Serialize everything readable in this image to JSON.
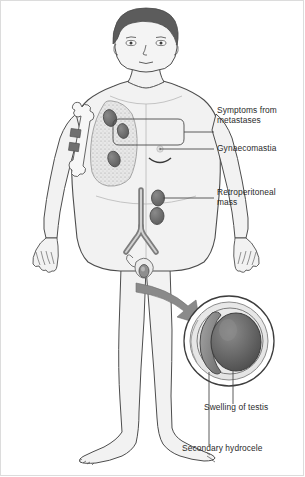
{
  "figure": {
    "type": "medical-illustration"
  },
  "labels": {
    "symptoms_metastases": "Symptoms from\nmetastases",
    "gynaecomastia": "Gynaecomastia",
    "retroperitoneal_mass": "Retroperitoneal\nmass",
    "swelling_of_testis": "Swelling of testis",
    "secondary_hydrocele": "Secondary hydrocele"
  },
  "anatomy": {
    "hair": "hair-region",
    "face": "face-region",
    "torso": "torso-region",
    "left_arm": "left-arm-region",
    "right_arm": "right-arm-region",
    "left_hand": "left-hand-region",
    "right_hand": "right-hand-region",
    "left_leg": "left-leg-region",
    "right_leg": "right-leg-region",
    "lung": "lung-with-metastases",
    "humerus": "humerus-bone-with-metastases",
    "aorta": "aorta-bifurcation",
    "nipple": "nipple-gynaecomastia",
    "scrotum": "scrotum-region",
    "inset_circle": "magnified-testis-inset",
    "testis": "testis-mass",
    "epididymis": "epididymis",
    "hydrocele_fluid": "hydrocele-fluid-layer",
    "magnify_arrow": "magnification-arrow"
  },
  "markers": {
    "lung_nodule_count": 3,
    "bone_metastasis_band_count": 2,
    "retroperitoneal_node_count": 2
  },
  "colors": {
    "outline": "#4d4d4d",
    "body_fill": "#f2f2f2",
    "hair_fill": "#5c5c5c",
    "nodule_fill": "#6e6e6e",
    "lung_fill": "#e4e4e4",
    "bone_fill": "#f7f7f7",
    "bone_lesion": "#707070",
    "testis_fill": "#686868",
    "epididymis_fill": "#8f8f8f",
    "arrow_fill": "#8a8a8a",
    "leader_line": "#4a4a4a",
    "text": "#2b2b2b",
    "frame_border": "#dcdcdc",
    "background": "#ffffff"
  }
}
